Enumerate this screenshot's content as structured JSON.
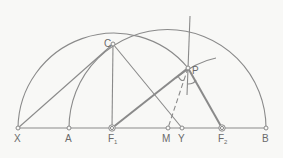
{
  "diagram": {
    "stroke_color": "#8a8a8a",
    "background": "#f8f8f6",
    "points": {
      "X": {
        "label": "X",
        "x": 18,
        "y": 128
      },
      "A": {
        "label": "A",
        "x": 69,
        "y": 128
      },
      "F1": {
        "label": "F",
        "sub": "1",
        "x": 112,
        "y": 128
      },
      "M": {
        "label": "M",
        "x": 168,
        "y": 128
      },
      "Y": {
        "label": "Y",
        "x": 182,
        "y": 128
      },
      "F2": {
        "label": "F",
        "sub": "2",
        "x": 222,
        "y": 128
      },
      "B": {
        "label": "B",
        "x": 266,
        "y": 128
      },
      "C": {
        "label": "C",
        "x": 113,
        "y": 44
      },
      "P": {
        "label": "P",
        "x": 188,
        "y": 68
      }
    }
  }
}
